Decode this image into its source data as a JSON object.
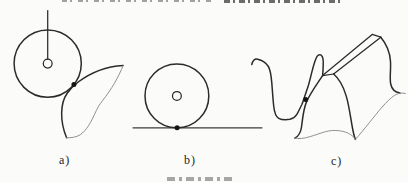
{
  "figure": {
    "panel_labels": [
      "a)",
      "b)",
      "c)"
    ]
  },
  "colors": {
    "background": "#fbfbf9",
    "line_dark": "#2b2b2b",
    "line_light": "#858585",
    "baseline": "#3d3d3d",
    "dot": "#141414",
    "label_text": "#1d1d1d",
    "clipped_fragments_top": "#474747",
    "clipped_fragments_caption": "#979797"
  },
  "clipped_text": {
    "top_line_present": true,
    "bottom_caption_present": true
  }
}
